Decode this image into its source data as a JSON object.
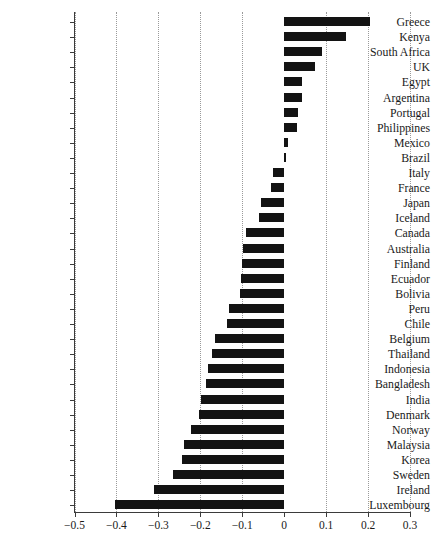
{
  "chart_data": {
    "type": "bar",
    "orientation": "horizontal",
    "title": "",
    "subtitle": "",
    "xlabel": "",
    "ylabel": "",
    "xlim": [
      -0.5,
      0.3
    ],
    "ylim": null,
    "grid": true,
    "grid_axis": "x",
    "grid_style": "dotted",
    "legend": null,
    "legend_position": "none",
    "bar_color": "#131313",
    "axis_color": "#3b3b3b",
    "background_color": "#ffffff",
    "xticks": [
      -0.5,
      -0.4,
      -0.3,
      -0.2,
      -0.1,
      0,
      0.1,
      0.2,
      0.3
    ],
    "xtick_labels": [
      "-0.5",
      "-0.4",
      "-0.3",
      "-0.2",
      "-0.1",
      "0",
      "0.1",
      "0.2",
      "0.3"
    ],
    "categories": [
      "Greece",
      "Kenya",
      "South Africa",
      "UK",
      "Egypt",
      "Argentina",
      "Portugal",
      "Philippines",
      "Mexico",
      "Brazil",
      "Italy",
      "France",
      "Japan",
      "Iceland",
      "Canada",
      "Australia",
      "Finland",
      "Ecuador",
      "Bolivia",
      "Peru",
      "Chile",
      "Belgium",
      "Thailand",
      "Indonesia",
      "Bangladesh",
      "India",
      "Denmark",
      "Norway",
      "Malaysia",
      "Korea",
      "Sweden",
      "Ireland",
      "Luxembourg"
    ],
    "values": [
      0.205,
      0.148,
      0.091,
      0.074,
      0.043,
      0.042,
      0.034,
      0.031,
      0.009,
      0.004,
      -0.026,
      -0.031,
      -0.055,
      -0.059,
      -0.092,
      -0.098,
      -0.101,
      -0.104,
      -0.106,
      -0.131,
      -0.137,
      -0.166,
      -0.172,
      -0.182,
      -0.186,
      -0.199,
      -0.202,
      -0.223,
      -0.24,
      -0.243,
      -0.265,
      -0.31,
      -0.403
    ]
  }
}
